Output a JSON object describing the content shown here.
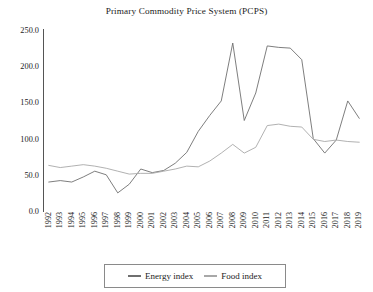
{
  "chart_data": {
    "type": "line",
    "title": "Primary Commodity Price System (PCPS)",
    "xlabel": "",
    "ylabel": "",
    "ylim": [
      0.0,
      250.0
    ],
    "yticks": [
      "0.0",
      "50.0",
      "100.0",
      "150.0",
      "200.0",
      "250.0"
    ],
    "ytick_values": [
      0,
      50,
      100,
      150,
      200,
      250
    ],
    "grid": false,
    "legend_position": "bottom-center",
    "categories": [
      "1992",
      "1993",
      "1994",
      "1995",
      "1996",
      "1997",
      "1998",
      "1999",
      "2000",
      "2001",
      "2002",
      "2003",
      "2004",
      "2005",
      "2006",
      "2007",
      "2008",
      "2009",
      "2010",
      "2011",
      "2012",
      "2013",
      "2014",
      "2015",
      "2016",
      "2017",
      "2018",
      "2019"
    ],
    "series": [
      {
        "name": "Energy index",
        "color": "#6f6f6f",
        "values": [
          40,
          42,
          40,
          47,
          55,
          50,
          25,
          37,
          58,
          53,
          56,
          66,
          81,
          110,
          132,
          152,
          232,
          125,
          163,
          228,
          226,
          225,
          209,
          100,
          80,
          98,
          152,
          128
        ]
      },
      {
        "name": "Food index",
        "color": "#a8a8a8",
        "values": [
          63,
          60,
          62,
          64,
          62,
          59,
          55,
          51,
          52,
          52,
          55,
          58,
          62,
          61,
          69,
          80,
          92,
          80,
          88,
          118,
          120,
          117,
          116,
          99,
          96,
          98,
          96,
          95
        ]
      }
    ]
  },
  "chart": {
    "title": "Primary Commodity Price System (PCPS)",
    "legend": [
      {
        "label": "Energy index",
        "color": "#6f6f6f"
      },
      {
        "label": "Food index",
        "color": "#a8a8a8"
      }
    ]
  }
}
